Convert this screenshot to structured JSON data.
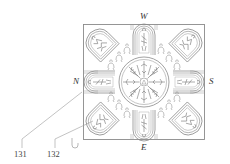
{
  "figure": {
    "type": "patent line drawing",
    "line_color": "#8a8a8a",
    "background": "#ffffff"
  },
  "compass": {
    "top": "W",
    "left": "N",
    "right": "S",
    "bottom": "E"
  },
  "reference_numerals": [
    {
      "id": "131",
      "label": "131"
    },
    {
      "id": "132",
      "label": "132"
    }
  ],
  "panels": [
    {
      "position": "top",
      "shape": "arch",
      "content": "standing figure"
    },
    {
      "position": "top-right",
      "shape": "arch",
      "content": "figure scene"
    },
    {
      "position": "right",
      "shape": "arch",
      "content": "reclining figure"
    },
    {
      "position": "bottom-right",
      "shape": "arch",
      "content": "standing figures"
    },
    {
      "position": "bottom",
      "shape": "arch",
      "content": "standing figure"
    },
    {
      "position": "bottom-left",
      "shape": "arch",
      "content": "figure scene"
    },
    {
      "position": "left",
      "shape": "arch",
      "content": "reclining figure"
    },
    {
      "position": "top-left",
      "shape": "arch",
      "content": "figure scene"
    }
  ],
  "center": {
    "shape": "circle",
    "content": "radiating figures medallion"
  }
}
